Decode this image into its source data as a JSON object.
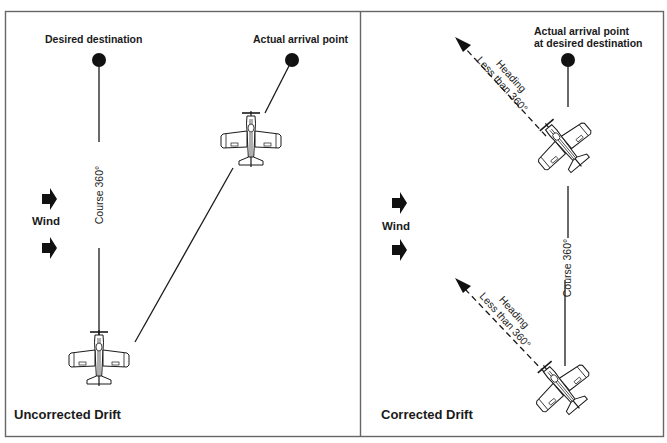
{
  "figure": {
    "colors": {
      "ink": "#1a1a1a",
      "frame": "#666666",
      "background": "#ffffff"
    },
    "left_panel": {
      "caption": "Uncorrected Drift",
      "desired_destination_label": "Desired destination",
      "actual_arrival_label": "Actual arrival point",
      "course_label": "Course 360°",
      "wind_label": "Wind",
      "icons": [
        "destination-dot",
        "arrival-dot",
        "wind-arrow",
        "wind-arrow",
        "airplane",
        "airplane"
      ]
    },
    "right_panel": {
      "caption": "Corrected Drift",
      "arrival_label_line1": "Actual arrival point",
      "arrival_label_line2": "at desired destination",
      "course_label": "Course 360°",
      "wind_label": "Wind",
      "heading_top_line1": "Heading",
      "heading_top_line2": "Less than 360°",
      "heading_bottom_line1": "Heading",
      "heading_bottom_line2": "Less than 360°",
      "icons": [
        "destination-dot",
        "wind-arrow",
        "wind-arrow",
        "airplane",
        "airplane",
        "heading-arrow",
        "heading-arrow"
      ]
    }
  }
}
